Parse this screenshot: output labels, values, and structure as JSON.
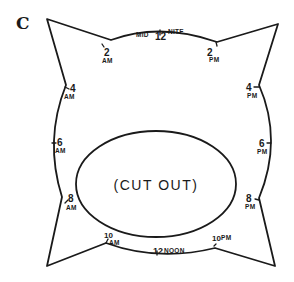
{
  "figure": {
    "panel_label": "C",
    "cutout_label": "(CUT OUT)",
    "hour_marks": [
      {
        "id": "midnight",
        "number": "12",
        "prefix": "MID",
        "suffix": "NITE"
      },
      {
        "id": "2am",
        "number": "2",
        "period": "AM"
      },
      {
        "id": "2pm",
        "number": "2",
        "period": "PM"
      },
      {
        "id": "4am",
        "number": "4",
        "period": "AM"
      },
      {
        "id": "4pm",
        "number": "4",
        "period": "PM"
      },
      {
        "id": "6am",
        "number": "6",
        "period": "AM"
      },
      {
        "id": "6pm",
        "number": "6",
        "period": "PM"
      },
      {
        "id": "8am",
        "number": "8",
        "period": "AM"
      },
      {
        "id": "8pm",
        "number": "8",
        "period": "PM"
      },
      {
        "id": "10am",
        "number": "10",
        "period": "AM"
      },
      {
        "id": "10pm",
        "number": "10",
        "period": "PM"
      },
      {
        "id": "noon",
        "number": "12",
        "suffix": "NOON"
      }
    ]
  }
}
